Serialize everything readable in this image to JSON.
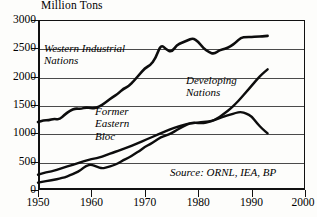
{
  "chart_data": {
    "type": "line",
    "title": "",
    "unit_caption": "Million Tons",
    "xlabel": "",
    "ylabel": "Million Tons",
    "xlim": [
      1950,
      2000
    ],
    "ylim": [
      0,
      3000
    ],
    "grid": true,
    "legend_position": "inline-annotations",
    "xticks": [
      1950,
      1960,
      1970,
      1980,
      1990,
      2000
    ],
    "yticks": [
      0,
      500,
      1000,
      1500,
      2000,
      2500,
      3000
    ],
    "source": "Source: ORNL, IEA, BP",
    "series": [
      {
        "name": "Western Industrial Nations",
        "label_lines": "Western Industrial\nNations",
        "x": [
          1950,
          1951,
          1952,
          1953,
          1954,
          1955,
          1956,
          1957,
          1958,
          1959,
          1960,
          1961,
          1962,
          1963,
          1964,
          1965,
          1966,
          1967,
          1968,
          1969,
          1970,
          1971,
          1972,
          1973,
          1974,
          1975,
          1976,
          1977,
          1978,
          1979,
          1980,
          1981,
          1982,
          1983,
          1984,
          1985,
          1986,
          1987,
          1988,
          1989,
          1990,
          1991,
          1992,
          1993
        ],
        "values": [
          1200,
          1230,
          1230,
          1260,
          1240,
          1330,
          1400,
          1440,
          1430,
          1460,
          1440,
          1450,
          1500,
          1570,
          1640,
          1700,
          1790,
          1830,
          1930,
          2040,
          2150,
          2200,
          2320,
          2570,
          2480,
          2430,
          2560,
          2600,
          2640,
          2680,
          2620,
          2500,
          2430,
          2400,
          2470,
          2490,
          2530,
          2600,
          2690,
          2700,
          2700,
          2710,
          2710,
          2720
        ]
      },
      {
        "name": "Former Eastern Bloc",
        "label_lines": "Former\nEastern\nBloc",
        "x": [
          1950,
          1951,
          1952,
          1953,
          1954,
          1955,
          1956,
          1957,
          1958,
          1959,
          1960,
          1961,
          1962,
          1963,
          1964,
          1965,
          1966,
          1967,
          1968,
          1969,
          1970,
          1971,
          1972,
          1973,
          1974,
          1975,
          1976,
          1977,
          1978,
          1979,
          1980,
          1981,
          1982,
          1983,
          1984,
          1985,
          1986,
          1987,
          1988,
          1989,
          1990,
          1991,
          1992,
          1993
        ],
        "values": [
          270,
          300,
          320,
          340,
          370,
          400,
          430,
          460,
          490,
          520,
          545,
          560,
          590,
          625,
          660,
          690,
          730,
          760,
          800,
          840,
          880,
          920,
          960,
          1000,
          1040,
          1080,
          1110,
          1140,
          1170,
          1180,
          1190,
          1200,
          1210,
          1230,
          1270,
          1300,
          1330,
          1360,
          1380,
          1350,
          1300,
          1180,
          1080,
          1000
        ]
      },
      {
        "name": "Developing Nations",
        "label_lines": "Developing\nNations",
        "x": [
          1950,
          1951,
          1952,
          1953,
          1954,
          1955,
          1956,
          1957,
          1958,
          1959,
          1960,
          1961,
          1962,
          1963,
          1964,
          1965,
          1966,
          1967,
          1968,
          1969,
          1970,
          1971,
          1972,
          1973,
          1974,
          1975,
          1976,
          1977,
          1978,
          1979,
          1980,
          1981,
          1982,
          1983,
          1984,
          1985,
          1986,
          1987,
          1988,
          1989,
          1990,
          1991,
          1992,
          1993
        ],
        "values": [
          130,
          150,
          165,
          180,
          200,
          225,
          260,
          300,
          350,
          430,
          450,
          410,
          380,
          400,
          430,
          470,
          530,
          570,
          630,
          690,
          760,
          810,
          870,
          930,
          960,
          1000,
          1060,
          1110,
          1160,
          1190,
          1180,
          1180,
          1200,
          1230,
          1290,
          1360,
          1430,
          1520,
          1620,
          1730,
          1840,
          1950,
          2050,
          2130
        ]
      }
    ]
  },
  "axis": {
    "unit_caption": "Million Tons",
    "x_tick_labels": [
      "1950",
      "1960",
      "1970",
      "1980",
      "1990",
      "2000"
    ],
    "y_tick_labels": [
      "0",
      "500",
      "1000",
      "1500",
      "2000",
      "2500",
      "3000"
    ]
  },
  "annotations": {
    "western": "Western Industrial\nNations",
    "developing": "Developing\nNations",
    "eastern": "Former\nEastern\nBloc",
    "source": "Source: ORNL, IEA, BP"
  }
}
